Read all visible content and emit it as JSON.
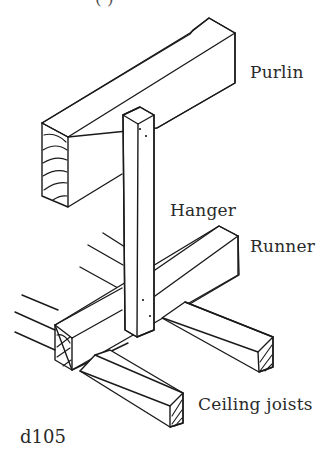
{
  "header": {
    "cut_text": "(     )"
  },
  "labels": {
    "purlin": "Purlin",
    "hanger": "Hanger",
    "runner": "Runner",
    "ceiling_joists": "Ceiling joists"
  },
  "figure": {
    "id": "d105"
  },
  "colors": {
    "ink": "#1a1a1a",
    "text": "#2a2a2a",
    "background": "#ffffff"
  }
}
